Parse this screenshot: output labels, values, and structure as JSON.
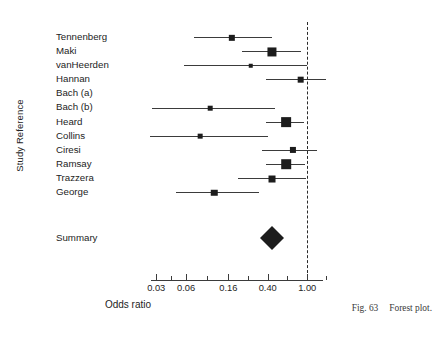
{
  "figure": {
    "caption_number": "Fig. 63",
    "caption_text": "Forest plot.",
    "ylabel": "Study Reference",
    "xlabel": "Odds ratio",
    "summary_label": "Summary"
  },
  "chart_data": {
    "type": "forest",
    "title": "Forest plot",
    "xlabel": "Odds ratio",
    "ylabel": "Study Reference",
    "xscale": "log",
    "xlim": [
      0.024,
      1.55
    ],
    "reference_line": 1.0,
    "grid": false,
    "legend": "none",
    "tick_labels": [
      "0.03",
      "0.06",
      "0.16",
      "0.40",
      "1.00"
    ],
    "tick_values": [
      0.03,
      0.06,
      0.16,
      0.4,
      1.0
    ],
    "minor_tick_values": [
      0.042,
      0.098,
      0.25,
      0.63,
      1.55
    ],
    "categories": [
      "Tennenberg",
      "Maki",
      "vanHeerden",
      "Hannan",
      "Bach (a)",
      "Bach (b)",
      "Heard",
      "Collins",
      "Ciresi",
      "Ramsay",
      "Trazzera",
      "George"
    ],
    "studies": [
      {
        "label": "Tennenberg",
        "or": 0.175,
        "ci_low": 0.073,
        "ci_high": 0.44,
        "weight": 0.38,
        "has_data": true
      },
      {
        "label": "Maki",
        "or": 0.44,
        "ci_low": 0.22,
        "ci_high": 0.86,
        "weight": 0.72,
        "has_data": true
      },
      {
        "label": "vanHeerden",
        "or": 0.27,
        "ci_low": 0.057,
        "ci_high": 1.0,
        "weight": 0.16,
        "has_data": true
      },
      {
        "label": "Hannan",
        "or": 0.86,
        "ci_low": 0.38,
        "ci_high": 1.55,
        "weight": 0.42,
        "has_data": true
      },
      {
        "label": "Bach (a)",
        "or": null,
        "ci_low": null,
        "ci_high": null,
        "weight": 0,
        "has_data": false
      },
      {
        "label": "Bach (b)",
        "or": 0.105,
        "ci_low": 0.027,
        "ci_high": 0.47,
        "weight": 0.17,
        "has_data": true
      },
      {
        "label": "Heard",
        "or": 0.61,
        "ci_low": 0.38,
        "ci_high": 0.92,
        "weight": 0.8,
        "has_data": true
      },
      {
        "label": "Collins",
        "or": 0.083,
        "ci_low": 0.026,
        "ci_high": 0.4,
        "weight": 0.18,
        "has_data": true
      },
      {
        "label": "Ciresi",
        "or": 0.72,
        "ci_low": 0.35,
        "ci_high": 1.25,
        "weight": 0.36,
        "has_data": true
      },
      {
        "label": "Ramsay",
        "or": 0.61,
        "ci_low": 0.38,
        "ci_high": 0.95,
        "weight": 0.78,
        "has_data": true
      },
      {
        "label": "Trazzera",
        "or": 0.44,
        "ci_low": 0.2,
        "ci_high": 0.98,
        "weight": 0.46,
        "has_data": true
      },
      {
        "label": "George",
        "or": 0.115,
        "ci_low": 0.047,
        "ci_high": 0.33,
        "weight": 0.4,
        "has_data": true
      }
    ],
    "summary": {
      "label": "Summary",
      "or": 0.44,
      "ci_low": 0.33,
      "ci_high": 0.58
    }
  }
}
